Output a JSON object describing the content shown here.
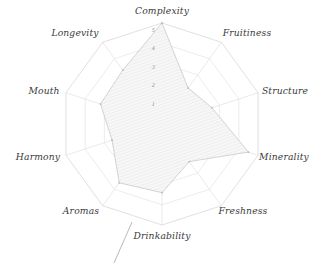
{
  "chart_data": {
    "type": "radar",
    "title": "",
    "subtitle": "",
    "xlabel": "",
    "ylabel": "",
    "categories": [
      "Complexity",
      "Fruitiness",
      "Structure",
      "Minerality",
      "Freshness",
      "Drinkability",
      "Aromas",
      "Harmony",
      "Mouth",
      "Longevity"
    ],
    "series": [
      {
        "name": "",
        "values": [
          5.0,
          2.2,
          2.6,
          4.5,
          2.3,
          3.4,
          3.6,
          2.6,
          3.2,
          3.3
        ]
      }
    ],
    "tick_labels": [
      "1",
      "2",
      "3",
      "4",
      "5"
    ],
    "tick_values": [
      1,
      2,
      3,
      4,
      5
    ],
    "rlim": [
      0,
      5
    ],
    "grid": true,
    "grid_rings": 5,
    "legend": "none",
    "tick_axis": "Complexity",
    "start_angle_deg": 90,
    "direction": "clockwise",
    "fill_style": "hatched",
    "colors": {
      "grid": "#dcdcdc",
      "outer_ring": "#d2d2d2",
      "spoke": "#d8d8d8",
      "series_stroke": "#c6c6c6",
      "series_fill": "#ededed",
      "label": "#3a3a3a",
      "tick_label": "#8e8e8e",
      "background": "#ffffff"
    }
  },
  "labels": {
    "complexity": "Complexity",
    "fruitiness": "Fruitiness",
    "structure": "Structure",
    "minerality": "Minerality",
    "freshness": "Freshness",
    "drinkability": "Drinkability",
    "aromas": "Aromas",
    "harmony": "Harmony",
    "mouth": "Mouth",
    "longevity": "Longevity"
  },
  "ticks": {
    "t1": "1",
    "t2": "2",
    "t3": "3",
    "t4": "4",
    "t5": "5"
  }
}
